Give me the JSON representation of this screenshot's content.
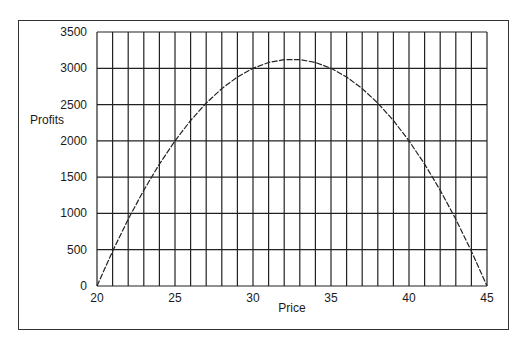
{
  "chart_data": {
    "type": "line",
    "title": "",
    "xlabel": "Price",
    "ylabel": "Profits",
    "xlim": [
      20,
      45
    ],
    "ylim": [
      0,
      3500
    ],
    "grid": true,
    "legend": null,
    "x_ticks": [
      20,
      25,
      30,
      35,
      40,
      45
    ],
    "y_ticks": [
      0,
      500,
      1000,
      1500,
      2000,
      2500,
      3000,
      3500
    ],
    "x_gridline_step": 1,
    "y_gridline_step": 500,
    "series": [
      {
        "name": "Profits",
        "color": "#222222",
        "x": [
          20,
          21,
          22,
          23,
          24,
          25,
          26,
          27,
          28,
          29,
          30,
          31,
          32,
          33,
          34,
          35,
          36,
          37,
          38,
          39,
          40,
          41,
          42,
          43,
          44,
          45
        ],
        "values": [
          0,
          480,
          920,
          1320,
          1680,
          2000,
          2280,
          2520,
          2720,
          2880,
          3000,
          3080,
          3120,
          3120,
          3080,
          3000,
          2880,
          2720,
          2520,
          2280,
          2000,
          1680,
          1320,
          920,
          480,
          0
        ]
      }
    ]
  }
}
